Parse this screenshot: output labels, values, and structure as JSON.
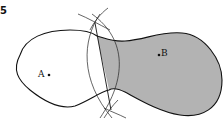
{
  "figure": {
    "number": "5",
    "points": [
      {
        "label": "A",
        "x": 49,
        "y": 75
      },
      {
        "label": "B",
        "x": 159,
        "y": 55
      }
    ],
    "colors": {
      "shaded": "#b3b3b3",
      "stroke": "#111111"
    }
  }
}
